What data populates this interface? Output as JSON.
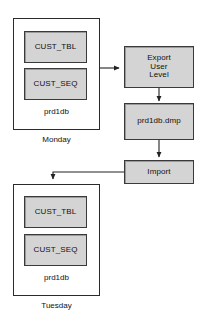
{
  "diagram": {
    "type": "flowchart",
    "colors": {
      "shaded_fill": "#d4d4d4",
      "container_fill": "#ffffff",
      "stroke": "#2b2b2b",
      "text": "#111111",
      "background": "#ffffff"
    },
    "nodes": {
      "monday_db": {
        "label": "prd1db",
        "caption": "Monday",
        "tables": [
          {
            "label": "CUST_TBL"
          },
          {
            "label": "CUST_SEQ"
          }
        ]
      },
      "export": {
        "label": "Export\nUser\nLevel"
      },
      "dumpfile": {
        "label": "prd1db.dmp"
      },
      "import": {
        "label": "Import"
      },
      "tuesday_db": {
        "label": "prd1db",
        "caption": "Tuesday",
        "tables": [
          {
            "label": "CUST_TBL"
          },
          {
            "label": "CUST_SEQ"
          }
        ]
      }
    },
    "connections": [
      {
        "from": "monday_db",
        "to": "export",
        "direction": "right"
      },
      {
        "from": "export",
        "to": "dumpfile",
        "direction": "down"
      },
      {
        "from": "dumpfile",
        "to": "import",
        "direction": "down"
      },
      {
        "from": "import",
        "to": "tuesday_db",
        "direction": "left-then-down"
      }
    ]
  }
}
